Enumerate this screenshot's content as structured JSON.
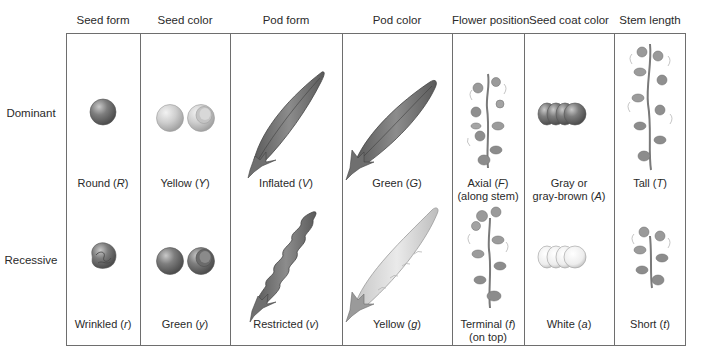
{
  "columns": [
    {
      "header": "Seed form",
      "dominant": {
        "text": "Round",
        "allele": "R",
        "illustration": "round-seed"
      },
      "recessive": {
        "text": "Wrinkled",
        "allele": "r",
        "illustration": "wrinkled-seed"
      }
    },
    {
      "header": "Seed color",
      "dominant": {
        "text": "Yellow",
        "allele": "Y",
        "illustration": "yellow-seeds"
      },
      "recessive": {
        "text": "Green",
        "allele": "y",
        "illustration": "green-seeds"
      }
    },
    {
      "header": "Pod form",
      "dominant": {
        "text": "Inflated",
        "allele": "V",
        "illustration": "inflated-pod"
      },
      "recessive": {
        "text": "Restricted",
        "allele": "v",
        "illustration": "restricted-pod"
      }
    },
    {
      "header": "Pod color",
      "dominant": {
        "text": "Green",
        "allele": "G",
        "illustration": "green-pod"
      },
      "recessive": {
        "text": "Yellow",
        "allele": "g",
        "illustration": "yellow-pod"
      }
    },
    {
      "header": "Flower position",
      "dominant": {
        "text": "Axial",
        "allele": "F",
        "note": "(along stem)",
        "illustration": "axial-flowers-plant"
      },
      "recessive": {
        "text": "Terminal",
        "allele": "f",
        "note": "(on top)",
        "illustration": "terminal-flowers-plant"
      }
    },
    {
      "header": "Seed coat color",
      "dominant": {
        "text_line1": "Gray or",
        "text": "gray-brown",
        "allele": "A",
        "illustration": "gray-seed-coats"
      },
      "recessive": {
        "text": "White",
        "allele": "a",
        "illustration": "white-seed-coats"
      }
    },
    {
      "header": "Stem length",
      "dominant": {
        "text": "Tall",
        "allele": "T",
        "illustration": "tall-plant"
      },
      "recessive": {
        "text": "Short",
        "allele": "t",
        "illustration": "short-plant"
      }
    }
  ],
  "rows": {
    "dominant_label": "Dominant",
    "recessive_label": "Recessive"
  },
  "colors": {
    "border": "#6e6e6e",
    "dark_gray": "#7a7a7a",
    "mid_gray": "#9a9a9a",
    "light_gray": "#cfcfcf",
    "white_seed": "#eeeeee"
  },
  "punct": {
    "open": " (",
    "close": ")"
  }
}
